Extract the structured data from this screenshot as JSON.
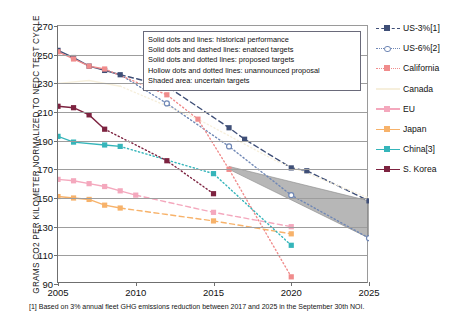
{
  "axes": {
    "ylabel": "GRAMS CO2 PER KILOMETER NORMALIZED TO NEDC TEST CYCLE",
    "yticks": [
      "270",
      "250",
      "230",
      "210",
      "190",
      "170",
      "150",
      "130",
      "110",
      "90"
    ],
    "xticks": [
      "2005",
      "2010",
      "2015",
      "2020",
      "2025"
    ]
  },
  "description_box": {
    "lines": [
      "Solid dots and lines: historical performance",
      "Solid dots and dashed lines: enatced targets",
      "Solid dots and dotted lines: proposed targets",
      "Hollow dots and dotted lines: unannounced proposal",
      "Shaded area: uncertain targets"
    ]
  },
  "legend": {
    "items": [
      {
        "label": "US-3%[1]",
        "color": "#3f4f77",
        "style": "dashed",
        "marker": "square"
      },
      {
        "label": "US-6%[2]",
        "color": "#6f87b5",
        "style": "dotted",
        "marker": "hollow-circle"
      },
      {
        "label": "California",
        "color": "#f08c8c",
        "style": "dotted",
        "marker": "square"
      },
      {
        "label": "Canada",
        "color": "#f6efdc",
        "style": "solid",
        "marker": "none"
      },
      {
        "label": "EU",
        "color": "#f4a8bd",
        "style": "solid",
        "marker": "square"
      },
      {
        "label": "Japan",
        "color": "#f7b26a",
        "style": "solid",
        "marker": "square"
      },
      {
        "label": "China[3]",
        "color": "#35b5ba",
        "style": "solid",
        "marker": "square"
      },
      {
        "label": "S. Korea",
        "color": "#7d2340",
        "style": "solid",
        "marker": "square"
      }
    ]
  },
  "footnote": "[1] Based on 3% annual fleet GHG emissions reduction between 2017 and 2025 in the September 30th NOI.",
  "chart_data": {
    "type": "line",
    "title": "",
    "xlabel": "",
    "ylabel": "GRAMS CO2 PER KILOMETER NORMALIZED TO NEDC TEST CYCLE",
    "xlim": [
      2005,
      2025
    ],
    "ylim": [
      90,
      270
    ],
    "grid": true,
    "legend_position": "right",
    "series": [
      {
        "name": "US-3%[1]",
        "color": "#3f4f77",
        "historical": {
          "x": [
            2005,
            2006,
            2007,
            2008,
            2009
          ],
          "y": [
            253,
            248,
            242,
            239,
            236
          ]
        },
        "enacted": {
          "x": [
            2009,
            2012,
            2016,
            2017,
            2020,
            2021,
            2025
          ],
          "y": [
            236,
            228,
            199,
            191,
            171,
            169,
            148
          ]
        },
        "style_historical": "solid",
        "style_projected": "dashed",
        "marker": "square"
      },
      {
        "name": "US-6%[2]",
        "color": "#6f87b5",
        "proposed": {
          "x": [
            2009,
            2012,
            2016,
            2020,
            2025
          ],
          "y": [
            236,
            216,
            186,
            152,
            122
          ]
        },
        "style_projected": "dotted",
        "marker": "hollow-circle"
      },
      {
        "name": "California",
        "color": "#f08c8c",
        "historical": {
          "x": [
            2005,
            2006,
            2007,
            2008
          ],
          "y": [
            252,
            247,
            242,
            240
          ]
        },
        "proposed": {
          "x": [
            2008,
            2012,
            2014,
            2016,
            2020
          ],
          "y": [
            240,
            222,
            205,
            170,
            95
          ]
        },
        "style_historical": "solid",
        "style_projected": "dotted",
        "marker": "square"
      },
      {
        "name": "Canada",
        "color": "#f6efdc",
        "historical": {
          "x": [
            2005,
            2007,
            2009
          ],
          "y": [
            230,
            232,
            228
          ]
        },
        "proposed": {
          "x": [
            2009,
            2014,
            2019,
            2025
          ],
          "y": [
            228,
            205,
            176,
            150
          ]
        },
        "style_historical": "solid",
        "style_projected": "dotted",
        "marker": "none"
      },
      {
        "name": "EU",
        "color": "#f4a8bd",
        "historical": {
          "x": [
            2005,
            2006,
            2007,
            2008,
            2009,
            2010
          ],
          "y": [
            163,
            162,
            160,
            158,
            155,
            152
          ]
        },
        "enacted": {
          "x": [
            2010,
            2015,
            2020
          ],
          "y": [
            152,
            140,
            130
          ]
        },
        "style_historical": "solid",
        "style_projected": "dashed",
        "marker": "square"
      },
      {
        "name": "Japan",
        "color": "#f7b26a",
        "historical": {
          "x": [
            2005,
            2006,
            2007,
            2008,
            2009
          ],
          "y": [
            151,
            150,
            149,
            145,
            143
          ]
        },
        "enacted": {
          "x": [
            2009,
            2015,
            2020
          ],
          "y": [
            143,
            134,
            125
          ]
        },
        "style_historical": "solid",
        "style_projected": "dashed",
        "marker": "square"
      },
      {
        "name": "China[3]",
        "color": "#35b5ba",
        "historical": {
          "x": [
            2005,
            2006,
            2008,
            2009
          ],
          "y": [
            193,
            189,
            187,
            186
          ]
        },
        "proposed": {
          "x": [
            2009,
            2015,
            2020
          ],
          "y": [
            186,
            167,
            117
          ]
        },
        "style_historical": "solid",
        "style_projected": "dotted",
        "marker": "square"
      },
      {
        "name": "S. Korea",
        "color": "#7d2340",
        "historical": {
          "x": [
            2005,
            2006,
            2007,
            2008
          ],
          "y": [
            214,
            213,
            208,
            198
          ]
        },
        "proposed": {
          "x": [
            2008,
            2012,
            2015
          ],
          "y": [
            198,
            176,
            153
          ]
        },
        "style_historical": "solid",
        "style_projected": "dotted",
        "marker": "square"
      }
    ],
    "shaded_band": {
      "label": "uncertain targets",
      "color": "#8a8a8a",
      "x": [
        2016,
        2025
      ],
      "y_upper": [
        172,
        148
      ],
      "y_lower": [
        170,
        122
      ]
    }
  }
}
